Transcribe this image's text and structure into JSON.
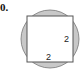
{
  "problem": {
    "number": "0."
  },
  "figure": {
    "side_label_right": "2",
    "side_label_bottom": "2",
    "colors": {
      "shade": "#c8c8c8",
      "square_fill": "#ffffff",
      "stroke": "#555555"
    }
  }
}
